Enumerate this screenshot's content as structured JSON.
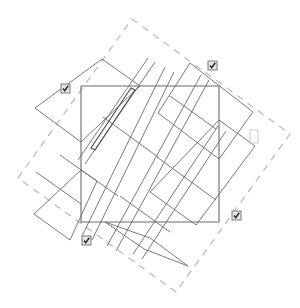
{
  "diagram": {
    "width": 300,
    "height": 308,
    "colors": {
      "background": "#ffffff",
      "stroke": "#6b6b6b",
      "dashed": "#b8b8b8",
      "checkbox_border": "#7a7a7a",
      "checkbox_fill": "#e6e6e6",
      "checkmark": "#333333",
      "empty_box": "#c8c8c8"
    },
    "outer_dashed_rect": [
      [
        132,
        19
      ],
      [
        290,
        134
      ],
      [
        176,
        292
      ],
      [
        18,
        178
      ]
    ],
    "center_square": [
      [
        81,
        86
      ],
      [
        219,
        86
      ],
      [
        219,
        222
      ],
      [
        81,
        222
      ]
    ],
    "tilted_panels": [
      {
        "name": "panel-top-left",
        "points": [
          [
            102,
            59
          ],
          [
            140,
            86
          ],
          [
            81,
            142
          ],
          [
            35,
            108
          ]
        ]
      },
      {
        "name": "panel-top",
        "points": [
          [
            190,
            63
          ],
          [
            253,
            112
          ],
          [
            219,
            159
          ],
          [
            158,
            113
          ]
        ]
      },
      {
        "name": "panel-right",
        "points": [
          [
            219,
            120
          ],
          [
            255,
            146
          ],
          [
            196,
            225
          ],
          [
            150,
            192
          ]
        ]
      },
      {
        "name": "panel-bottom-left",
        "points": [
          [
            81,
            170
          ],
          [
            97,
            181
          ],
          [
            70,
            240
          ],
          [
            34,
            214
          ]
        ]
      },
      {
        "name": "panel-bottom",
        "points": [
          [
            105,
            222
          ],
          [
            144,
            249
          ],
          [
            188,
            266
          ],
          [
            150,
            238
          ]
        ]
      }
    ],
    "strips": [
      {
        "name": "strip-1",
        "x1": 148,
        "y1": 58,
        "x2": 78,
        "y2": 160
      },
      {
        "name": "strip-2",
        "x1": 155,
        "y1": 62,
        "x2": 85,
        "y2": 164
      },
      {
        "name": "strip-3",
        "x1": 165,
        "y1": 67,
        "x2": 82,
        "y2": 236
      },
      {
        "name": "strip-4",
        "x1": 174,
        "y1": 72,
        "x2": 92,
        "y2": 240
      },
      {
        "name": "strip-5",
        "x1": 201,
        "y1": 75,
        "x2": 107,
        "y2": 246
      },
      {
        "name": "strip-6",
        "x1": 209,
        "y1": 80,
        "x2": 116,
        "y2": 251
      },
      {
        "name": "strip-7",
        "x1": 218,
        "y1": 126,
        "x2": 133,
        "y2": 254
      },
      {
        "name": "strip-8",
        "x1": 226,
        "y1": 131,
        "x2": 142,
        "y2": 259
      }
    ],
    "cross_lines": [
      {
        "name": "cross-1",
        "x1": 103,
        "y1": 117,
        "x2": 158,
        "y2": 157
      },
      {
        "name": "cross-2",
        "x1": 157,
        "y1": 157,
        "x2": 216,
        "y2": 200
      },
      {
        "name": "cross-3",
        "x1": 60,
        "y1": 155,
        "x2": 118,
        "y2": 196
      },
      {
        "name": "cross-4",
        "x1": 120,
        "y1": 196,
        "x2": 170,
        "y2": 232
      },
      {
        "name": "cross-5",
        "x1": 36,
        "y1": 172,
        "x2": 81,
        "y2": 204
      },
      {
        "name": "cross-6",
        "x1": 170,
        "y1": 96,
        "x2": 216,
        "y2": 129
      }
    ],
    "bold_strip": [
      [
        131,
        88
      ],
      [
        91,
        148
      ],
      [
        95,
        150
      ],
      [
        135,
        90
      ]
    ],
    "checkboxes": [
      {
        "name": "checkbox-top-left",
        "x": 61,
        "y": 84,
        "size": 9,
        "checked": true
      },
      {
        "name": "checkbox-top-right",
        "x": 208,
        "y": 61,
        "size": 9,
        "checked": true
      },
      {
        "name": "checkbox-bottom-left",
        "x": 82,
        "y": 236,
        "size": 9,
        "checked": true
      },
      {
        "name": "checkbox-bottom-right",
        "x": 232,
        "y": 211,
        "size": 9,
        "checked": true
      }
    ],
    "empty_box": {
      "name": "empty-box-right",
      "x": 250,
      "y": 130,
      "width": 8,
      "height": 13
    }
  }
}
